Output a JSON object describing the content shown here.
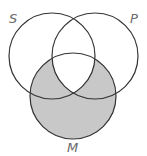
{
  "diagram": {
    "type": "venn",
    "sets": [
      {
        "label": "S",
        "cx": 52,
        "cy": 56,
        "r": 43
      },
      {
        "label": "P",
        "cx": 95,
        "cy": 56,
        "r": 43
      },
      {
        "label": "M",
        "cx": 73,
        "cy": 96,
        "r": 43
      }
    ],
    "label_positions": {
      "S": {
        "x": 9,
        "y": 23
      },
      "P": {
        "x": 130,
        "y": 23
      },
      "M": {
        "x": 67,
        "y": 152
      }
    },
    "shaded_region": "M minus (S and P)",
    "colors": {
      "stroke": "#333333",
      "shade": "#c8c8c8",
      "label": "#6a6a6a",
      "background": "#ffffff"
    }
  }
}
